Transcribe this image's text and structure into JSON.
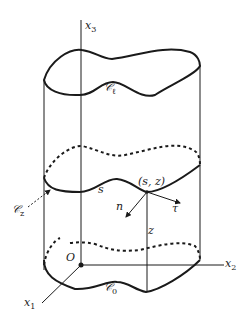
{
  "diagram": {
    "axes": {
      "x3": {
        "base": "x",
        "sub": "3"
      },
      "x2": {
        "base": "x",
        "sub": "2"
      },
      "x1": {
        "base": "x",
        "sub": "1"
      },
      "origin": "O"
    },
    "curves": {
      "top": {
        "base": "𝒞",
        "sub": "ℓ"
      },
      "middle": {
        "base": "𝒞",
        "sub": "z"
      },
      "bottom": {
        "base": "𝒞",
        "sub": "0"
      }
    },
    "point_label": "(s, z)",
    "arc_param": "s",
    "height_label": "z",
    "normal": "n",
    "tangent": "τ",
    "colors": {
      "stroke": "#1a1a1a",
      "background": "#ffffff"
    }
  }
}
